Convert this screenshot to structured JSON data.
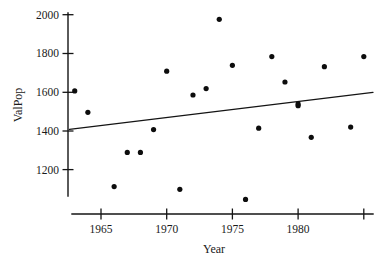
{
  "chart_data": {
    "type": "scatter",
    "title": "",
    "xlabel": "Year",
    "ylabel": "ValPop",
    "xlim": [
      1962.3,
      1985.8
    ],
    "ylim": [
      1020,
      2010
    ],
    "grid": false,
    "legend": null,
    "xticks": [
      1965,
      1970,
      1975,
      1980
    ],
    "xtick_labels": [
      "1965",
      "1970",
      "1975",
      "1980"
    ],
    "yticks": [
      1200,
      1400,
      1600,
      1800,
      2000
    ],
    "ytick_labels": [
      "1200",
      "1400",
      "1600",
      "1800",
      "2000"
    ],
    "x": [
      1963,
      1964,
      1966,
      1967,
      1968,
      1969,
      1970,
      1971,
      1972,
      1973,
      1974,
      1975,
      1976,
      1977,
      1978,
      1979,
      1980,
      1980,
      1981,
      1982,
      1984,
      1985
    ],
    "y": [
      1607,
      1497,
      1114,
      1290,
      1290,
      1408,
      1709,
      1100,
      1586,
      1619,
      1976,
      1739,
      1048,
      1415,
      1784,
      1653,
      1531,
      1540,
      1368,
      1732,
      1421,
      1784
    ],
    "points": [
      {
        "year": 1963,
        "valpop": 1607
      },
      {
        "year": 1964,
        "valpop": 1497
      },
      {
        "year": 1966,
        "valpop": 1114
      },
      {
        "year": 1967,
        "valpop": 1290
      },
      {
        "year": 1968,
        "valpop": 1290
      },
      {
        "year": 1969,
        "valpop": 1408
      },
      {
        "year": 1970,
        "valpop": 1709
      },
      {
        "year": 1971,
        "valpop": 1100
      },
      {
        "year": 1972,
        "valpop": 1586
      },
      {
        "year": 1973,
        "valpop": 1619
      },
      {
        "year": 1974,
        "valpop": 1976
      },
      {
        "year": 1975,
        "valpop": 1739
      },
      {
        "year": 1976,
        "valpop": 1048
      },
      {
        "year": 1977,
        "valpop": 1415
      },
      {
        "year": 1978,
        "valpop": 1784
      },
      {
        "year": 1979,
        "valpop": 1653
      },
      {
        "year": 1980,
        "valpop": 1531
      },
      {
        "year": 1980,
        "valpop": 1540
      },
      {
        "year": 1981,
        "valpop": 1368
      },
      {
        "year": 1982,
        "valpop": 1732
      },
      {
        "year": 1984,
        "valpop": 1421
      },
      {
        "year": 1985,
        "valpop": 1784
      }
    ],
    "trend_line": {
      "name": "least-squares fit",
      "x_start": 1962.6,
      "y_start": 1409,
      "x_end": 1985.7,
      "y_end": 1600
    },
    "marker_color": "#0d0d0d",
    "line_color": "#141414",
    "axis_color": "#141414",
    "background_color": "#ffffff"
  }
}
